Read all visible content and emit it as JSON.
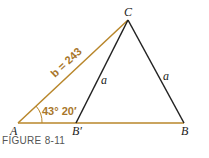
{
  "figure": {
    "caption": "FIGURE 8-11",
    "vertices": {
      "A": "A",
      "B_prime": "B′",
      "B": "B",
      "C": "C"
    },
    "side_labels": {
      "b": "b = 243",
      "a_left": "a",
      "a_right": "a"
    },
    "angle_label": "43° 20′",
    "colors": {
      "accent": "#b8862a",
      "line": "#222222"
    }
  }
}
